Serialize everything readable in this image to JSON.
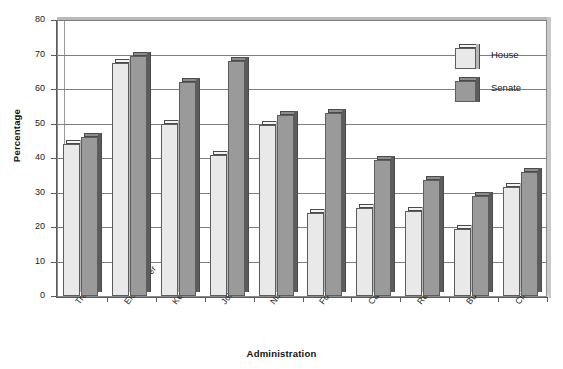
{
  "chart_data": {
    "type": "bar",
    "title": "",
    "xlabel": "Administration",
    "ylabel": "Percentage",
    "ylim": [
      0,
      80
    ],
    "yticks": [
      0,
      10,
      20,
      30,
      40,
      50,
      60,
      70,
      80
    ],
    "grid": true,
    "legend_position": "top-right",
    "categories": [
      "Truman",
      "Eisenhower",
      "Kennedy",
      "Johnson",
      "Nixon",
      "Ford",
      "Carter",
      "Reagan",
      "Bush",
      "Clinton"
    ],
    "series": [
      {
        "name": "House",
        "color": "#e9e9e9",
        "values": [
          44,
          67.5,
          50,
          41,
          49.5,
          24,
          25.5,
          24.5,
          19.5,
          31.5
        ]
      },
      {
        "name": "Senate",
        "color": "#9a9a9a",
        "values": [
          46,
          69.5,
          62,
          68,
          52.5,
          53,
          39.5,
          33.5,
          29,
          36
        ]
      }
    ]
  },
  "axes": {
    "y_title": "Percentage",
    "x_title": "Administration",
    "y_tick_labels": [
      "0",
      "10",
      "20",
      "30",
      "40",
      "50",
      "60",
      "70",
      "80"
    ]
  },
  "legend": {
    "items": [
      {
        "label": "House",
        "swatch": "light-gray-cube"
      },
      {
        "label": "Senate",
        "swatch": "dark-gray-cube"
      }
    ]
  }
}
